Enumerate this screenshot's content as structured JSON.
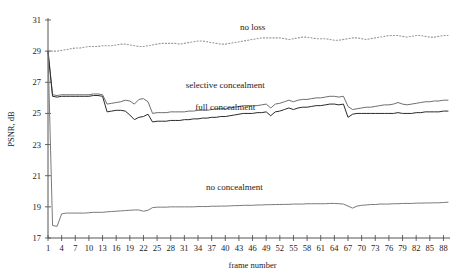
{
  "chart_data": {
    "type": "line",
    "title": "",
    "xlabel": "frame number",
    "ylabel": "PSNR, dB",
    "xlim": [
      1,
      89
    ],
    "ylim": [
      17,
      31
    ],
    "grid": false,
    "legend_position": "inline-annotations",
    "xticks": [
      1,
      4,
      7,
      10,
      13,
      16,
      19,
      22,
      25,
      28,
      31,
      34,
      37,
      40,
      43,
      46,
      49,
      52,
      55,
      58,
      61,
      64,
      67,
      70,
      73,
      76,
      79,
      82,
      85,
      88
    ],
    "yticks": [
      17,
      19,
      21,
      23,
      25,
      27,
      29,
      31
    ],
    "x": [
      1,
      2,
      3,
      4,
      5,
      6,
      7,
      8,
      9,
      10,
      11,
      12,
      13,
      14,
      15,
      16,
      17,
      18,
      19,
      20,
      21,
      22,
      23,
      24,
      25,
      26,
      27,
      28,
      29,
      30,
      31,
      32,
      33,
      34,
      35,
      36,
      37,
      38,
      39,
      40,
      41,
      42,
      43,
      44,
      45,
      46,
      47,
      48,
      49,
      50,
      51,
      52,
      53,
      54,
      55,
      56,
      57,
      58,
      59,
      60,
      61,
      62,
      63,
      64,
      65,
      66,
      67,
      68,
      69,
      70,
      71,
      72,
      73,
      74,
      75,
      76,
      77,
      78,
      79,
      80,
      81,
      82,
      83,
      84,
      85,
      86,
      87,
      88,
      89
    ],
    "series": [
      {
        "name": "no loss",
        "style": "dotted",
        "color": "#9a9a9a",
        "label": "no loss",
        "label_x": 46,
        "label_y": 30.35,
        "values": [
          29.05,
          29.0,
          29.0,
          29.05,
          29.1,
          29.15,
          29.2,
          29.2,
          29.25,
          29.3,
          29.3,
          29.3,
          29.35,
          29.35,
          29.35,
          29.4,
          29.45,
          29.45,
          29.4,
          29.35,
          29.3,
          29.3,
          29.35,
          29.4,
          29.45,
          29.5,
          29.5,
          29.5,
          29.5,
          29.45,
          29.5,
          29.55,
          29.6,
          29.65,
          29.65,
          29.6,
          29.55,
          29.5,
          29.45,
          29.45,
          29.5,
          29.55,
          29.6,
          29.65,
          29.7,
          29.75,
          29.8,
          29.85,
          29.85,
          29.85,
          29.85,
          29.85,
          29.8,
          29.75,
          29.8,
          29.85,
          29.9,
          29.9,
          29.85,
          29.8,
          29.8,
          29.8,
          29.75,
          29.7,
          29.7,
          29.75,
          29.8,
          29.85,
          29.85,
          29.8,
          29.75,
          29.8,
          29.85,
          29.9,
          29.95,
          30.0,
          30.0,
          30.0,
          29.95,
          29.9,
          29.95,
          30.0,
          30.0,
          29.95,
          29.9,
          29.9,
          29.95,
          30.0,
          30.0
        ]
      },
      {
        "name": "selective concealment",
        "style": "solid",
        "color": "#6e6e6e",
        "label": "selective concealment",
        "label_x": 40,
        "label_y": 26.65,
        "values": [
          29.0,
          26.2,
          26.15,
          26.2,
          26.2,
          26.2,
          26.2,
          26.2,
          26.2,
          26.2,
          26.25,
          26.25,
          26.2,
          25.6,
          25.65,
          25.7,
          25.75,
          25.85,
          25.8,
          25.6,
          25.9,
          25.95,
          25.75,
          25.0,
          25.05,
          25.05,
          25.05,
          25.1,
          25.1,
          25.1,
          25.1,
          25.15,
          25.15,
          25.2,
          25.2,
          25.2,
          25.25,
          25.3,
          25.3,
          25.3,
          25.35,
          25.4,
          25.45,
          25.5,
          25.5,
          25.5,
          25.5,
          25.55,
          25.6,
          25.35,
          25.6,
          25.65,
          25.75,
          25.85,
          25.75,
          25.85,
          25.9,
          25.9,
          25.95,
          26.0,
          26.0,
          26.05,
          26.1,
          26.1,
          26.05,
          26.1,
          25.45,
          25.25,
          25.3,
          25.35,
          25.4,
          25.4,
          25.45,
          25.5,
          25.55,
          25.55,
          25.6,
          25.7,
          25.6,
          25.55,
          25.6,
          25.65,
          25.7,
          25.75,
          25.75,
          25.8,
          25.8,
          25.85,
          25.85
        ]
      },
      {
        "name": "full concealment",
        "style": "solid",
        "color": "#2a2a2a",
        "label": "full concealment",
        "label_x": 40,
        "label_y": 25.25,
        "values": [
          29.0,
          26.1,
          26.05,
          26.1,
          26.1,
          26.1,
          26.1,
          26.1,
          26.1,
          26.1,
          26.15,
          26.15,
          26.1,
          25.1,
          25.15,
          25.2,
          25.2,
          25.15,
          24.9,
          24.6,
          24.75,
          24.8,
          24.95,
          24.45,
          24.5,
          24.5,
          24.5,
          24.55,
          24.55,
          24.55,
          24.6,
          24.6,
          24.65,
          24.65,
          24.7,
          24.7,
          24.75,
          24.75,
          24.8,
          24.8,
          24.85,
          24.9,
          24.95,
          25.0,
          25.0,
          25.0,
          25.05,
          25.05,
          25.1,
          24.85,
          25.1,
          25.15,
          25.25,
          25.35,
          25.25,
          25.35,
          25.4,
          25.4,
          25.45,
          25.5,
          25.5,
          25.55,
          25.6,
          25.6,
          25.55,
          25.6,
          24.75,
          24.95,
          25.0,
          25.0,
          25.0,
          25.0,
          25.0,
          25.0,
          25.0,
          25.0,
          25.0,
          25.05,
          25.0,
          25.0,
          25.0,
          25.05,
          25.05,
          25.1,
          25.1,
          25.1,
          25.1,
          25.15,
          25.15
        ]
      },
      {
        "name": "no concealment",
        "style": "solid",
        "color": "#7a7a7a",
        "label": "no concealment",
        "label_x": 42,
        "label_y": 20.1,
        "values": [
          29.0,
          17.8,
          17.75,
          18.55,
          18.6,
          18.6,
          18.6,
          18.6,
          18.6,
          18.62,
          18.65,
          18.65,
          18.65,
          18.68,
          18.7,
          18.72,
          18.74,
          18.76,
          18.78,
          18.8,
          18.8,
          18.72,
          18.78,
          18.95,
          18.98,
          18.98,
          18.98,
          19.0,
          19.0,
          19.0,
          19.0,
          19.0,
          19.0,
          19.02,
          19.02,
          19.02,
          19.04,
          19.04,
          19.05,
          19.05,
          19.06,
          19.08,
          19.08,
          19.1,
          19.1,
          19.1,
          19.12,
          19.12,
          19.14,
          19.14,
          19.15,
          19.15,
          19.16,
          19.16,
          19.18,
          19.18,
          19.18,
          19.2,
          19.2,
          19.2,
          19.2,
          19.2,
          19.22,
          19.22,
          19.2,
          19.18,
          19.05,
          18.92,
          19.05,
          19.1,
          19.12,
          19.15,
          19.15,
          19.18,
          19.18,
          19.18,
          19.2,
          19.2,
          19.22,
          19.22,
          19.22,
          19.24,
          19.24,
          19.25,
          19.25,
          19.26,
          19.26,
          19.28,
          19.3
        ]
      }
    ]
  }
}
